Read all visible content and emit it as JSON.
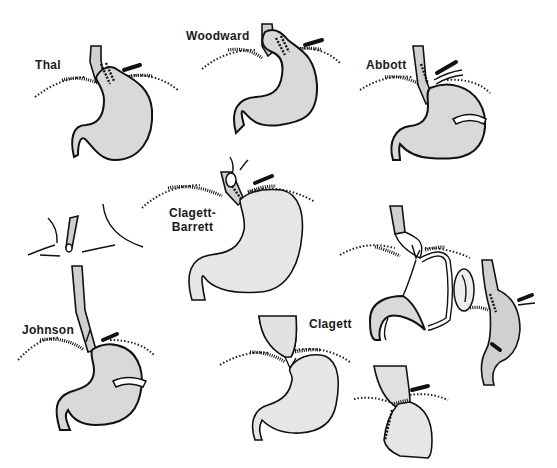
{
  "figure": {
    "background": "#ffffff",
    "ink_color": "#111111",
    "fill_color": "#d9d9d9"
  },
  "panels": [
    {
      "id": "thal",
      "label": "Thal"
    },
    {
      "id": "woodward",
      "label": "Woodward"
    },
    {
      "id": "abbott",
      "label": "Abbott"
    },
    {
      "id": "clagett-barrett",
      "label_line1": "Clagett-",
      "label_line2": "Barrett"
    },
    {
      "id": "johnson",
      "label": "Johnson"
    },
    {
      "id": "clagett",
      "label": "Clagett"
    },
    {
      "id": "gastric-tube",
      "label": ""
    },
    {
      "id": "esophageal-segment",
      "label": ""
    },
    {
      "id": "junction-closeup",
      "label": ""
    }
  ]
}
